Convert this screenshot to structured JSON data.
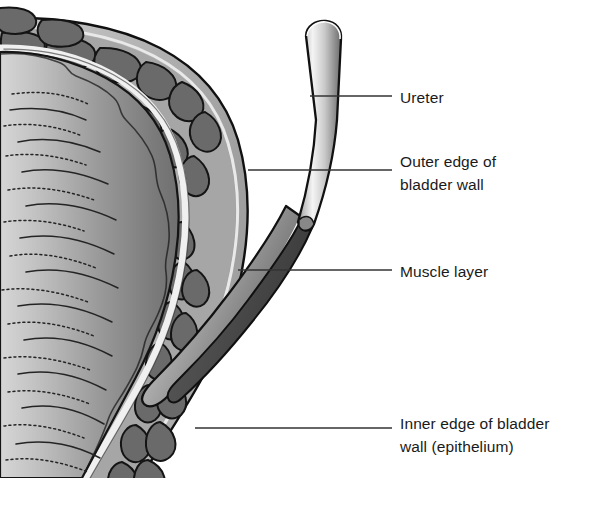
{
  "figure": {
    "background_color": "#ffffff"
  },
  "callouts": [
    {
      "id": "ureter",
      "label": "Ureter",
      "leader": {
        "x1": 310,
        "y1": 96,
        "x2": 392,
        "y2": 96
      },
      "text_x": 400,
      "text_y": 86
    },
    {
      "id": "outer-edge",
      "label": "Outer edge of\nbladder wall",
      "leader": {
        "x1": 248,
        "y1": 170,
        "x2": 392,
        "y2": 170
      },
      "text_x": 400,
      "text_y": 150
    },
    {
      "id": "muscle-layer",
      "label": "Muscle layer",
      "leader": {
        "x1": 238,
        "y1": 270,
        "x2": 392,
        "y2": 270
      },
      "text_x": 400,
      "text_y": 260
    },
    {
      "id": "inner-edge",
      "label": "Inner edge of bladder\nwall (epithelium)",
      "leader": {
        "x1": 195,
        "y1": 428,
        "x2": 392,
        "y2": 428
      },
      "text_x": 400,
      "text_y": 412
    }
  ],
  "structures": {
    "ureter": {
      "name": "ureter-tube",
      "fill_light": "#f2f2f2",
      "fill_mid": "#a8a8a8",
      "fill_dark": "#6e6e6e"
    },
    "serosa": {
      "name": "outer-serosa-rim",
      "fill": "#b4b4b4"
    },
    "muscle_band": {
      "name": "muscle-layer-band",
      "fill": "#a5a5a5"
    },
    "muscle_bundles": {
      "name": "muscle-bundle-blobs",
      "fill": "#6b6b6b",
      "stroke": "#141414",
      "count": 38
    },
    "epithelium": {
      "name": "epithelium-line",
      "fill": "#ececec"
    },
    "lumen": {
      "name": "bladder-lumen",
      "fill_light": "#c8c8c8",
      "fill_dark": "#777777"
    },
    "rugae": {
      "name": "rugae-folds",
      "stroke": "#222222",
      "count": 16
    },
    "outline": {
      "name": "outer-outline",
      "stroke": "#101010"
    }
  },
  "colors": {
    "ink": "#1a1a1a",
    "leader": "#333333",
    "background": "#ffffff"
  }
}
